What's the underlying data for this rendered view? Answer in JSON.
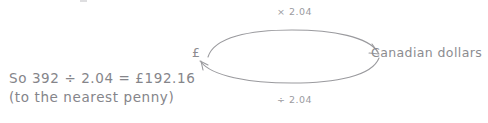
{
  "diagram": {
    "nodes": {
      "left_label": "£",
      "right_label": "Canadian dollars"
    },
    "arrows": {
      "top_label": "× 2.04",
      "bottom_label": "÷ 2.04",
      "top_direction": "left-to-right",
      "bottom_direction": "right-to-left"
    },
    "colors": {
      "ink": "#8a8a8e",
      "arrow_stroke": "#9a9a9e",
      "background": "#ffffff"
    }
  },
  "working": {
    "line1": "So 392 ÷ 2.04 = £192.16",
    "line2": "(to the nearest penny)"
  }
}
